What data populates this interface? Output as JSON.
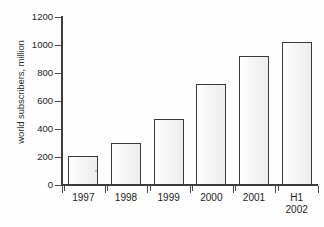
{
  "chart_data": {
    "type": "bar",
    "title": "",
    "subtitle": "",
    "xlabel": "",
    "ylabel": "world subscribers, million",
    "categories": [
      "1997",
      "1998",
      "1999",
      "2000",
      "2001",
      "H1\n2002"
    ],
    "category_labels_display": [
      "1997",
      "1998",
      "1999",
      "2000",
      "2001",
      "H1 2002"
    ],
    "values": [
      205,
      300,
      475,
      720,
      925,
      1020
    ],
    "ylim": [
      0,
      1200
    ],
    "yticks": [
      0,
      200,
      400,
      600,
      800,
      1000,
      1200
    ],
    "ytick_labels": [
      "0",
      "200",
      "400",
      "600",
      "800",
      "1000",
      "1200"
    ],
    "xlim_categories": 6,
    "grid": false,
    "legend": false,
    "legend_position": "none",
    "bar_fill_color": "#fbfbfb",
    "bar_edge_color": "#3a3a3a",
    "axis_color": "#3c3c3c",
    "text_color": "#222222",
    "background_color": "#ffffff",
    "series": [
      {
        "name": "world subscribers",
        "unit": "million",
        "values": [
          205,
          300,
          475,
          720,
          925,
          1020
        ]
      }
    ],
    "annotations": []
  },
  "axis": {
    "y_title": "world subscribers, million",
    "y_ticks": [
      {
        "label": "1200",
        "value": 1200
      },
      {
        "label": "1000",
        "value": 1000
      },
      {
        "label": "800",
        "value": 800
      },
      {
        "label": "600",
        "value": 600
      },
      {
        "label": "400",
        "value": 400
      },
      {
        "label": "200",
        "value": 200
      },
      {
        "label": "0",
        "value": 0
      }
    ],
    "x_labels": [
      {
        "line1": "1997",
        "line2": ""
      },
      {
        "line1": "1998",
        "line2": ""
      },
      {
        "line1": "1999",
        "line2": ""
      },
      {
        "line1": "2000",
        "line2": ""
      },
      {
        "line1": "2001",
        "line2": ""
      },
      {
        "line1": "H1",
        "line2": "2002"
      }
    ]
  }
}
